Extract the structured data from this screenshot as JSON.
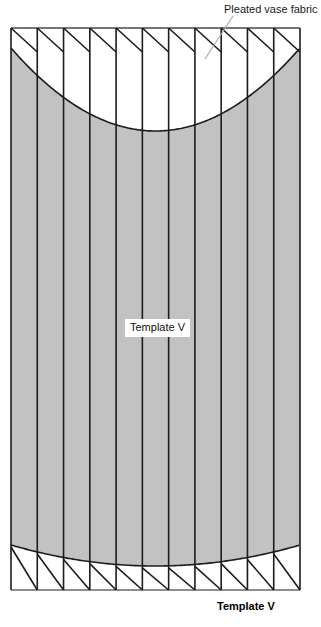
{
  "figure": {
    "title": "Pleated vase fabric template",
    "background_color": "#ffffff",
    "fabric_fill_color": "#c2c2c2",
    "line_color": "#1c1c1c",
    "leader_line_color": "#a8a8a8",
    "width_px": 321,
    "height_px": 627
  },
  "annotations": {
    "callout_pleated_fabric": "Pleated vase fabric",
    "inline_template_label": "Template V",
    "bottom_caption": "Template V"
  },
  "geometry": {
    "panel_count": 11,
    "fold_line_count": 12,
    "left_edge_x": 11,
    "right_edge_x": 300,
    "panel_width": 26.3,
    "tab_top_y": 28,
    "tab_bottom_y": 50,
    "body_top_y": 48,
    "body_bottom_y": 548,
    "tab_foot_y": 590,
    "top_curve_vertex_y": 131,
    "top_curve_edge_y": 48,
    "bottom_curve_vertex_y": 566,
    "bottom_curve_edge_y": 545,
    "leader_line": {
      "x1": 233,
      "y1": 16,
      "x2": 205,
      "y2": 59
    }
  },
  "icons": {
    "fold_line": "vertical-fold-line",
    "pleat_tab": "diagonal-pleat-tab",
    "fabric_region": "curved-fabric-panel"
  }
}
